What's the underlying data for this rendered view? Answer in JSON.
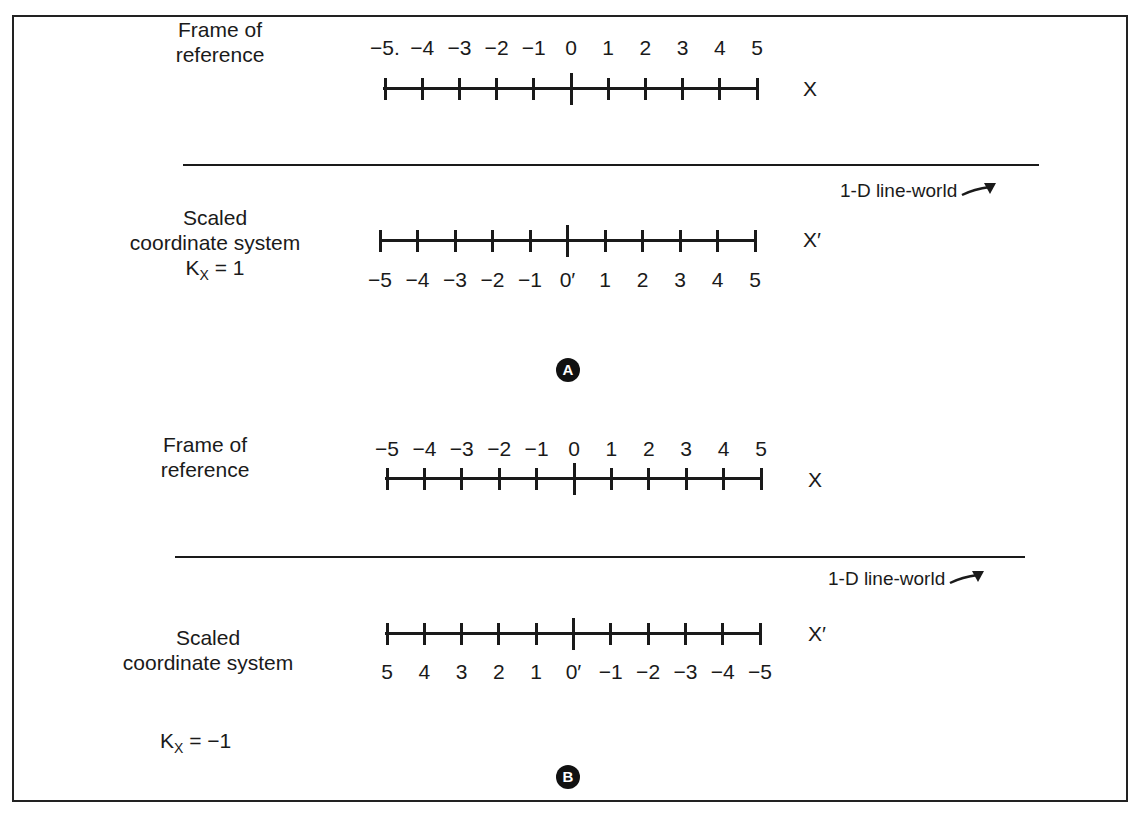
{
  "panel_a": {
    "badge": "A",
    "frame": {
      "label_line1": "Frame of",
      "label_line2": "reference",
      "axis_name": "X",
      "ticks": [
        "−5.",
        "−4",
        "−3",
        "−2",
        "−1",
        "0",
        "1",
        "2",
        "3",
        "4",
        "5"
      ]
    },
    "world_label": "1-D line-world",
    "scaled": {
      "label_line1": "Scaled",
      "label_line2": "coordinate system",
      "k_label": "K",
      "k_sub": "X",
      "k_value": " = 1",
      "axis_name": "X′",
      "ticks": [
        "−5",
        "−4",
        "−3",
        "−2",
        "−1",
        "0′",
        "1",
        "2",
        "3",
        "4",
        "5"
      ]
    }
  },
  "panel_b": {
    "badge": "B",
    "frame": {
      "label_line1": "Frame of",
      "label_line2": "reference",
      "axis_name": "X",
      "ticks": [
        "−5",
        "−4",
        "−3",
        "−2",
        "−1",
        "0",
        "1",
        "2",
        "3",
        "4",
        "5"
      ]
    },
    "world_label": "1-D line-world",
    "scaled": {
      "label_line1": "Scaled",
      "label_line2": "coordinate system",
      "k_label": "K",
      "k_sub": "X",
      "k_value": " = −1",
      "axis_name": "X′",
      "ticks": [
        "5",
        "4",
        "3",
        "2",
        "1",
        "0′",
        "−1",
        "−2",
        "−3",
        "−4",
        "−5"
      ]
    }
  },
  "colors": {
    "ink": "#1a1a1a",
    "background": "#ffffff",
    "badge": "#111111"
  }
}
